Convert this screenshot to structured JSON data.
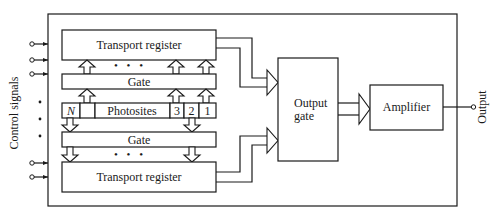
{
  "diagram": {
    "type": "block-diagram",
    "side_labels": {
      "left": "Control signals",
      "right": "Output"
    },
    "blocks": {
      "top_register": "Transport register",
      "top_gate": "Gate",
      "photosites": {
        "cells": [
          "N",
          "",
          "Photosites",
          "3",
          "2",
          "1"
        ]
      },
      "bottom_gate": "Gate",
      "bottom_register": "Transport register",
      "output_gate": {
        "line1": "Output",
        "line2": "gate"
      },
      "amplifier": "Amplifier"
    },
    "ellipsis": "• • •",
    "control_inputs_top": 3,
    "control_inputs_bottom": 2,
    "colors": {
      "stroke": "#1a1a1a",
      "fill": "#ffffff"
    }
  }
}
